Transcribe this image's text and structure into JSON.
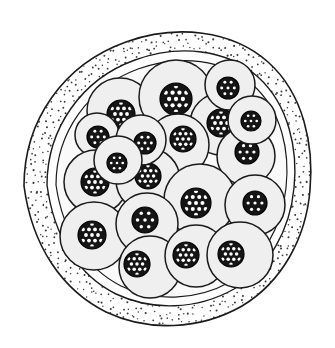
{
  "figure": {
    "kind": "histological-cross-section",
    "caption": "",
    "canvas": {
      "width": 335,
      "height": 348,
      "background": "#ffffff"
    }
  },
  "colors": {
    "background": "#ffffff",
    "outline": "#1a1a1a",
    "capsule_fill": "#ffffff",
    "stipple_dot": "#3a3a3a",
    "lumen_fill": "#fafafa",
    "cell_fill": "#efefef",
    "cell_outline": "#1a1a1a",
    "nucleus_fill": "#151515",
    "nucleus_ring": "#000000",
    "chromatin_dot": "#ffffff"
  },
  "capsule": {
    "label": "outer capsule",
    "outer_path": "M 24 186 C 24 120 64 64 126 42 C 176 24 232 30 268 62 C 304 94 314 146 310 190 C 306 238 282 282 242 306 C 200 330 148 332 106 312 C 62 290 32 246 24 186 Z",
    "inner_path": "M 47 185 C 47 128 82 79 135 60 C 179 44 227 49 258 77 C 289 105 298 150 294 188 C 290 230 269 268 234 289 C 197 310 152 311 116 294 C 78 275 54 237 47 185 Z",
    "stroke_width": 1.6,
    "stipple": {
      "description": "fine scattered dots between outer and inner capsule outlines",
      "dot_radius": 0.85,
      "density": "medium",
      "color": "#3a3a3a"
    }
  },
  "lumen": {
    "label": "inner lumen containing cell mass",
    "path": "M 56 185 C 56 132 89 87 138 69 C 180 54 224 59 253 85 C 282 111 290 152 286 188 C 282 227 262 262 230 282 C 196 301 154 302 121 286 C 86 268 63 233 56 185 Z",
    "fill": "#fafafa",
    "stroke_width": 1.2
  },
  "cells": [
    {
      "id": "cell-01",
      "cx": 120,
      "cy": 111,
      "r": 33,
      "nucleus": {
        "cx": 121,
        "cy": 114,
        "r": 14,
        "dot_rows": 4
      }
    },
    {
      "id": "cell-02",
      "cx": 176,
      "cy": 97,
      "r": 37,
      "nucleus": {
        "cx": 176,
        "cy": 99,
        "r": 16,
        "dot_rows": 4
      }
    },
    {
      "id": "cell-03",
      "cx": 97,
      "cy": 135,
      "r": 22,
      "nucleus": {
        "cx": 98,
        "cy": 137,
        "r": 11,
        "dot_rows": 3
      }
    },
    {
      "id": "cell-04",
      "cx": 221,
      "cy": 124,
      "r": 31,
      "nucleus": {
        "cx": 221,
        "cy": 123,
        "r": 14,
        "dot_rows": 4
      }
    },
    {
      "id": "cell-05",
      "cx": 178,
      "cy": 145,
      "r": 31,
      "nucleus": {
        "cx": 183,
        "cy": 139,
        "r": 13,
        "dot_rows": 4
      }
    },
    {
      "id": "cell-06",
      "cx": 246,
      "cy": 156,
      "r": 29,
      "nucleus": {
        "cx": 247,
        "cy": 152,
        "r": 12,
        "dot_rows": 3
      }
    },
    {
      "id": "cell-07",
      "cx": 96,
      "cy": 182,
      "r": 32,
      "nucleus": {
        "cx": 95,
        "cy": 182,
        "r": 14,
        "dot_rows": 4
      }
    },
    {
      "id": "cell-08",
      "cx": 148,
      "cy": 180,
      "r": 32,
      "nucleus": {
        "cx": 148,
        "cy": 176,
        "r": 13,
        "dot_rows": 4
      }
    },
    {
      "id": "cell-09",
      "cx": 200,
      "cy": 200,
      "r": 36,
      "nucleus": {
        "cx": 196,
        "cy": 203,
        "r": 15,
        "dot_rows": 4
      }
    },
    {
      "id": "cell-10",
      "cx": 255,
      "cy": 205,
      "r": 30,
      "nucleus": {
        "cx": 255,
        "cy": 203,
        "r": 12,
        "dot_rows": 3
      }
    },
    {
      "id": "cell-11",
      "cx": 94,
      "cy": 236,
      "r": 34,
      "nucleus": {
        "cx": 92,
        "cy": 235,
        "r": 14,
        "dot_rows": 4
      }
    },
    {
      "id": "cell-12",
      "cx": 147,
      "cy": 224,
      "r": 31,
      "nucleus": {
        "cx": 145,
        "cy": 220,
        "r": 13,
        "dot_rows": 3
      }
    },
    {
      "id": "cell-13",
      "cx": 150,
      "cy": 267,
      "r": 31,
      "nucleus": {
        "cx": 137,
        "cy": 264,
        "r": 13,
        "dot_rows": 4
      }
    },
    {
      "id": "cell-14",
      "cx": 196,
      "cy": 256,
      "r": 31,
      "nucleus": {
        "cx": 186,
        "cy": 255,
        "r": 13,
        "dot_rows": 4
      }
    },
    {
      "id": "cell-15",
      "cx": 240,
      "cy": 255,
      "r": 33,
      "nucleus": {
        "cx": 231,
        "cy": 254,
        "r": 13,
        "dot_rows": 4
      }
    },
    {
      "id": "cell-16",
      "cx": 230,
      "cy": 85,
      "r": 25,
      "nucleus": {
        "cx": 228,
        "cy": 88,
        "r": 11,
        "dot_rows": 3
      }
    },
    {
      "id": "cell-17",
      "cx": 252,
      "cy": 120,
      "r": 24,
      "nucleus": {
        "cx": 251,
        "cy": 121,
        "r": 10,
        "dot_rows": 3
      }
    },
    {
      "id": "cell-18",
      "cx": 141,
      "cy": 140,
      "r": 25,
      "nucleus": {
        "cx": 145,
        "cy": 143,
        "r": 11,
        "dot_rows": 3
      }
    },
    {
      "id": "cell-19",
      "cx": 118,
      "cy": 160,
      "r": 24,
      "nucleus": {
        "cx": 117,
        "cy": 163,
        "r": 10,
        "dot_rows": 3
      }
    }
  ],
  "stipple_seed": 20250407
}
